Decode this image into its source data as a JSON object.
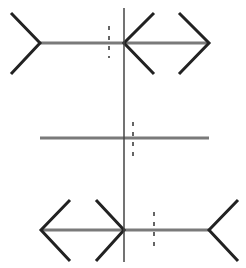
{
  "figure": {
    "type": "muller-lyer-illusion",
    "width": 246,
    "height": 268,
    "background": "#ffffff",
    "colors": {
      "shaft": "#7a7a7a",
      "fin": "#222222",
      "vertical": "#444444",
      "dashed": "#333333"
    },
    "vertical_line": {
      "x": 124,
      "y1": 8,
      "y2": 262
    },
    "rows": [
      {
        "name": "top-row",
        "y": 43,
        "shaft": {
          "x1": 40,
          "x2": 209
        },
        "fins": [
          {
            "name": "left-fin-out",
            "points": "11,13 40,43 11,74"
          },
          {
            "name": "middle-arrowhead-left",
            "points": "154,13 124,43 154,74"
          },
          {
            "name": "right-arrowhead-right",
            "points": "179,13 209,43 179,74"
          }
        ],
        "midpoint_marker": {
          "x": 109,
          "y1": 26,
          "y2": 58
        }
      },
      {
        "name": "middle-row",
        "y": 138,
        "shaft": {
          "x1": 40,
          "x2": 209
        },
        "fins": [],
        "midpoint_marker": {
          "x": 133,
          "y1": 122,
          "y2": 158
        }
      },
      {
        "name": "bottom-row",
        "y": 230,
        "shaft": {
          "x1": 41,
          "x2": 209
        },
        "fins": [
          {
            "name": "left-arrowhead-left",
            "points": "70,200 41,230 70,261"
          },
          {
            "name": "middle-arrowhead-right",
            "points": "96,200 124,230 96,261"
          },
          {
            "name": "right-fin-out",
            "points": "238,200 209,230 238,261"
          }
        ],
        "midpoint_marker": {
          "x": 154,
          "y1": 212,
          "y2": 248
        }
      }
    ]
  }
}
